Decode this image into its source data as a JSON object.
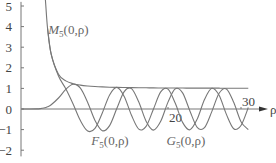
{
  "chart_data": {
    "type": "line",
    "title": "",
    "xlabel": "ρ",
    "ylabel": "",
    "xlim": [
      0,
      33
    ],
    "ylim": [
      -2.3,
      5.2
    ],
    "x_ticks": [
      {
        "value": 20,
        "label": "20"
      },
      {
        "value": 30,
        "label": "30"
      }
    ],
    "y_ticks": [
      {
        "value": 5,
        "label": "5"
      },
      {
        "value": 4,
        "label": "4"
      },
      {
        "value": 3,
        "label": "3"
      },
      {
        "value": 2,
        "label": "2"
      },
      {
        "value": 1,
        "label": "1"
      },
      {
        "value": 0,
        "label": "0"
      },
      {
        "value": -1,
        "label": "−1"
      },
      {
        "value": -2,
        "label": "−2"
      }
    ],
    "grid": false,
    "legend": "none",
    "series": [
      {
        "name": "F5(0,ρ)",
        "label_main": "F",
        "label_sub": "5",
        "label_args": "(0,ρ)",
        "label_at": [
          9.5,
          -1.75
        ],
        "x": [
          0,
          1,
          2,
          2.5,
          3,
          3.5,
          4,
          5,
          6,
          7,
          8,
          9,
          10,
          11,
          12,
          13,
          14,
          15,
          16,
          17,
          18,
          19,
          20,
          21,
          22,
          23,
          24,
          25,
          26,
          27,
          28,
          29,
          30,
          31
        ],
        "y": [
          0,
          0.0001,
          0.005,
          0.019,
          0.049,
          0.109,
          0.207,
          0.534,
          0.952,
          1.205,
          1.012,
          0.317,
          -0.555,
          -1.055,
          -0.809,
          0.032,
          0.845,
          0.99,
          0.338,
          -0.589,
          -1.024,
          -0.599,
          0.334,
          0.98,
          0.781,
          -0.094,
          -0.887,
          -0.903,
          -0.126,
          0.762,
          0.975,
          0.324,
          -0.615,
          -1.005
        ]
      },
      {
        "name": "G5(0,ρ)",
        "label_main": "G",
        "label_sub": "5",
        "label_args": "(0,ρ)",
        "label_at": [
          19.8,
          -1.75
        ],
        "x": [
          3.5,
          4,
          5,
          6,
          7,
          8,
          9,
          10,
          11,
          12,
          13,
          14,
          15,
          16,
          17,
          18,
          19,
          20,
          21,
          22,
          23,
          24,
          25,
          26,
          27,
          28,
          29,
          30,
          31
        ],
        "y": [
          3.922,
          2.651,
          1.602,
          0.982,
          0.243,
          -0.563,
          -1.071,
          -0.938,
          -0.192,
          0.683,
          1.049,
          0.61,
          -0.307,
          -0.975,
          -0.843,
          -0.011,
          0.828,
          0.963,
          0.275,
          -0.65,
          -1.01,
          -0.491,
          0.458,
          1.004,
          0.664,
          -0.262,
          -0.956,
          -0.799,
          0.07
        ]
      },
      {
        "name": "M5(0,ρ)",
        "label_main": "M",
        "label_sub": "5",
        "label_args": "(0,ρ)",
        "label_at": [
          3.6,
          3.65
        ],
        "x": [
          3.1,
          3.2,
          3.5,
          4,
          5,
          6,
          7,
          8,
          9,
          10,
          11,
          12,
          13,
          14,
          15,
          16,
          17,
          18,
          19,
          20,
          21,
          22,
          23,
          24,
          25,
          26,
          27,
          28,
          29,
          30,
          31
        ],
        "y": [
          5.7,
          5.32,
          3.92,
          2.66,
          1.69,
          1.367,
          1.229,
          1.158,
          1.117,
          1.09,
          1.072,
          1.059,
          1.049,
          1.042,
          1.036,
          1.031,
          1.028,
          1.024,
          1.022,
          1.02,
          1.018,
          1.016,
          1.015,
          1.013,
          1.012,
          1.011,
          1.011,
          1.01,
          1.009,
          1.008,
          1.007
        ]
      }
    ]
  }
}
